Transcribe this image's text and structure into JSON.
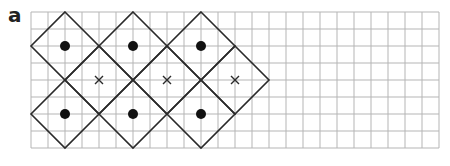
{
  "label": "a",
  "grid": {
    "x0": 31,
    "y0": 12,
    "cell": 17,
    "cols": 24,
    "rows": 8,
    "color": "#b5b5b5"
  },
  "shape_color": "#2a2a2a",
  "diamonds": [
    {
      "cx": 2,
      "cy": 2,
      "mark": "dot"
    },
    {
      "cx": 6,
      "cy": 2,
      "mark": "dot"
    },
    {
      "cx": 10,
      "cy": 2,
      "mark": "dot"
    },
    {
      "cx": 4,
      "cy": 4,
      "mark": "cross"
    },
    {
      "cx": 8,
      "cy": 4,
      "mark": "cross"
    },
    {
      "cx": 12,
      "cy": 4,
      "mark": "cross"
    },
    {
      "cx": 2,
      "cy": 6,
      "mark": "dot"
    },
    {
      "cx": 6,
      "cy": 6,
      "mark": "dot"
    },
    {
      "cx": 10,
      "cy": 6,
      "mark": "dot"
    }
  ],
  "diamond_radius_cells": 2
}
